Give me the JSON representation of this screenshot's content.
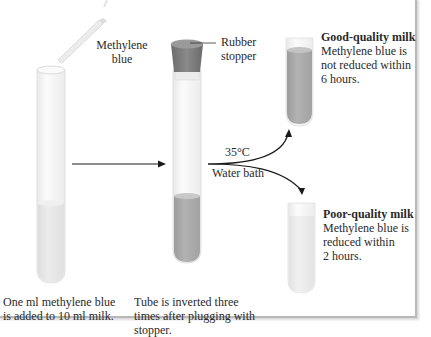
{
  "figure": {
    "colors": {
      "tube_glass": "#f4f4f4",
      "tube_outline": "#dcdcdc",
      "milk_light": "#e6e6e6",
      "milk_mixed": "#a9a9a9",
      "stopper": "#7a7a7a",
      "arrow": "#1a1a1a"
    }
  },
  "labels": {
    "methylene_blue": [
      "Methylene",
      "blue"
    ],
    "rubber_stopper": [
      "Rubber",
      "stopper"
    ],
    "temperature": "35°C",
    "water_bath": "Water bath",
    "step1_caption": [
      "One ml methylene blue",
      "is added to 10 ml milk."
    ],
    "step2_caption": [
      "Tube is inverted three",
      "times after plugging with",
      "stopper."
    ],
    "good": {
      "title": "Good-quality milk",
      "lines": [
        "Methylene blue is",
        "not reduced within",
        "6 hours."
      ]
    },
    "poor": {
      "title": "Poor-quality milk",
      "lines": [
        "Methylene blue is",
        "reduced within",
        "2 hours."
      ]
    }
  }
}
